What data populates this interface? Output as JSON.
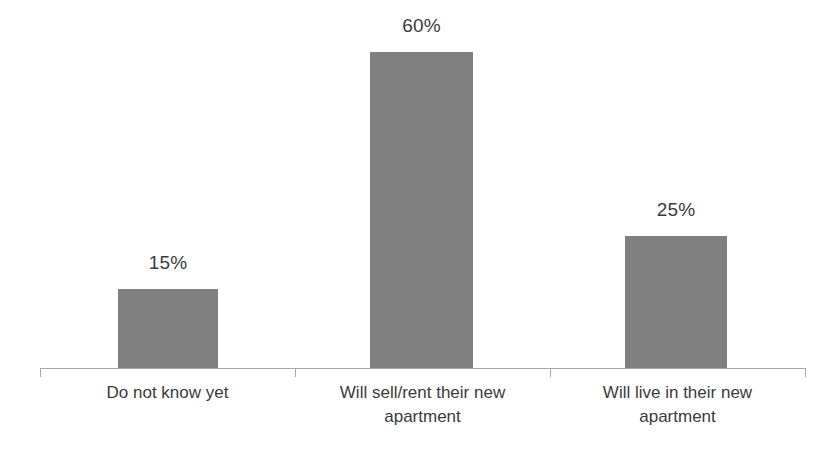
{
  "chart_data": {
    "type": "bar",
    "title": "",
    "subtitle": "",
    "xlabel": "",
    "ylabel": "",
    "categories": [
      "Do not know yet",
      "Will sell/rent their new apartment",
      "Will live in their new apartment"
    ],
    "values": [
      15,
      60,
      25
    ],
    "value_labels": [
      "15%",
      "60%",
      "25%"
    ],
    "ylim": [
      0,
      70
    ],
    "grid": false,
    "legend": null,
    "axis": {
      "x_axis_visible": true,
      "y_axis_visible": false,
      "tick_count": 4
    },
    "colors": {
      "bar": "#808080",
      "axis": "#a9a9a9",
      "text": "#3b3b3b",
      "background": "#ffffff"
    }
  },
  "labels": {
    "category_lines": [
      [
        "Do not know yet"
      ],
      [
        "Will sell/rent their new",
        "apartment"
      ],
      [
        "Will live in their new",
        "apartment"
      ]
    ]
  }
}
